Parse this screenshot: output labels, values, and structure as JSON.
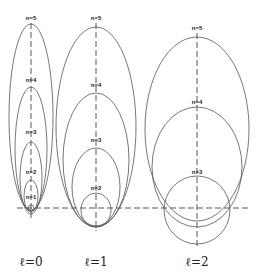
{
  "diagram": {
    "baseline_y": 208,
    "groups": [
      {
        "caption": "ℓ=0",
        "axis_x": 31,
        "orbits": [
          {
            "label": "n=5",
            "label_y": 20,
            "rx": 22,
            "ry": 93,
            "cy": 117
          },
          {
            "label": "n=4",
            "label_y": 82,
            "rx": 16,
            "ry": 62,
            "cy": 149
          },
          {
            "label": "n=3",
            "label_y": 134,
            "rx": 11,
            "ry": 36,
            "cy": 178
          },
          {
            "label": "n=2",
            "label_y": 174,
            "rx": 7,
            "ry": 16,
            "cy": 196
          },
          {
            "label": "n=1",
            "label_y": 199,
            "rx": 3,
            "ry": 3,
            "cy": 208
          }
        ]
      },
      {
        "caption": "ℓ=1",
        "axis_x": 96,
        "orbits": [
          {
            "label": "n=5",
            "label_y": 20,
            "rx": 40,
            "ry": 100,
            "cy": 127
          },
          {
            "label": "n=4",
            "label_y": 87,
            "rx": 33,
            "ry": 67,
            "cy": 160
          },
          {
            "label": "n=3",
            "label_y": 142,
            "rx": 24,
            "ry": 39,
            "cy": 187
          },
          {
            "label": "n=2",
            "label_y": 190,
            "rx": 15,
            "ry": 17,
            "cy": 210
          }
        ]
      },
      {
        "caption": "ℓ=2",
        "axis_x": 197,
        "orbits": [
          {
            "label": "n=5",
            "label_y": 30,
            "rx": 52,
            "ry": 92,
            "cy": 129
          },
          {
            "label": "n=4",
            "label_y": 104,
            "rx": 45,
            "ry": 60,
            "cy": 167
          },
          {
            "label": "n=3",
            "label_y": 174,
            "rx": 33,
            "ry": 34,
            "cy": 210
          }
        ]
      }
    ]
  }
}
